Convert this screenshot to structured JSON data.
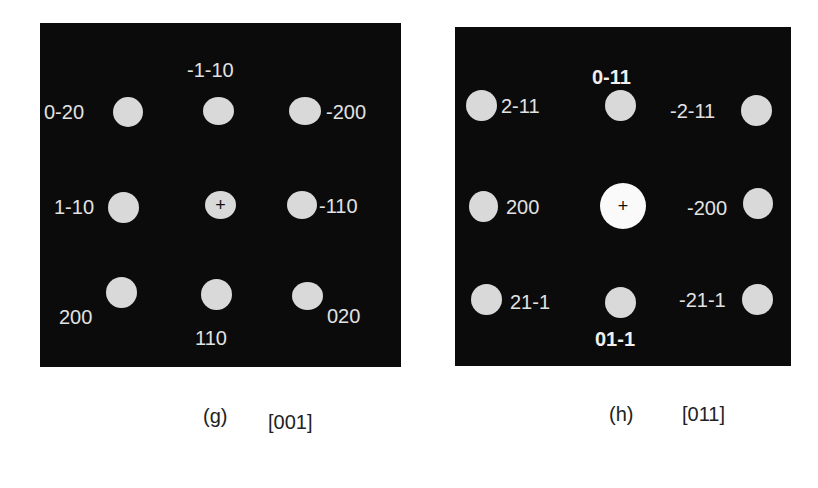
{
  "colors": {
    "panel_background": "#0b0b0b",
    "spot": "#d9d9d9",
    "center_spot_bright": "#fafafa",
    "label_text": "#e2e2e2",
    "caption_text": "#222222",
    "page_background": "#ffffff"
  },
  "panels": [
    {
      "id": "g",
      "caption_letter": "(g)",
      "zone_axis": "[001]",
      "center_marker": "+",
      "spots": [
        {
          "label": "0-20",
          "row": 0,
          "col": 0
        },
        {
          "label": "-1-10",
          "row": 0,
          "col": 1
        },
        {
          "label": "-200",
          "row": 0,
          "col": 2
        },
        {
          "label": "1-10",
          "row": 1,
          "col": 0
        },
        {
          "label": "",
          "row": 1,
          "col": 1,
          "center": true
        },
        {
          "label": "-110",
          "row": 1,
          "col": 2
        },
        {
          "label": "200",
          "row": 2,
          "col": 0
        },
        {
          "label": "110",
          "row": 2,
          "col": 1
        },
        {
          "label": "020",
          "row": 2,
          "col": 2
        }
      ]
    },
    {
      "id": "h",
      "caption_letter": "(h)",
      "zone_axis": "[011]",
      "center_marker": "+",
      "spots": [
        {
          "label": "2-11",
          "row": 0,
          "col": 0
        },
        {
          "label": "0-11",
          "row": 0,
          "col": 1,
          "bold": true
        },
        {
          "label": "-2-11",
          "row": 0,
          "col": 2
        },
        {
          "label": "200",
          "row": 1,
          "col": 0
        },
        {
          "label": "",
          "row": 1,
          "col": 1,
          "center": true
        },
        {
          "label": "-200",
          "row": 1,
          "col": 2
        },
        {
          "label": "21-1",
          "row": 2,
          "col": 0
        },
        {
          "label": "01-1",
          "row": 2,
          "col": 1,
          "bold": true
        },
        {
          "label": "-21-1",
          "row": 2,
          "col": 2
        }
      ]
    }
  ]
}
